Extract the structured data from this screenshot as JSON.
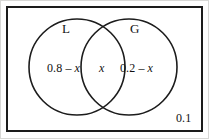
{
  "figure": {
    "type": "venn-diagram",
    "sets": [
      {
        "letter": "L",
        "side": "left"
      },
      {
        "letter": "G",
        "side": "right"
      }
    ],
    "regions": {
      "left_only": "0.8 – x",
      "intersection": "x",
      "right_only": "0.2 – x",
      "outside_both": "0.1"
    },
    "colors": {
      "stroke": "#1c1c1c",
      "background": "#ffffff",
      "text": "#111111"
    }
  }
}
